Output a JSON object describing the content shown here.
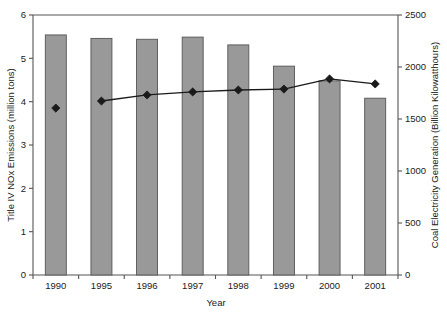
{
  "chart_data": {
    "type": "bar",
    "title": "",
    "subtitle": "",
    "xlabel": "Year",
    "categories": [
      "1990",
      "1995",
      "1996",
      "1997",
      "1998",
      "1999",
      "2000",
      "2001"
    ],
    "grid": false,
    "legend": "none",
    "axes": {
      "left": {
        "label": "Title IV NOx Emissions (million tons)",
        "ticks": [
          "0",
          "1",
          "2",
          "3",
          "4",
          "5",
          "6"
        ],
        "tick_values": [
          0,
          1,
          2,
          3,
          4,
          5,
          6
        ],
        "min": 0,
        "max": 6
      },
      "right": {
        "label": "Coal Electricity Generation (Billion Kilowatthours)",
        "ticks": [
          "0",
          "500",
          "1000",
          "1500",
          "2000",
          "2500"
        ],
        "tick_values": [
          0,
          500,
          1000,
          1500,
          2000,
          2500
        ],
        "min": 0,
        "max": 2500
      },
      "x": {
        "label": "Year"
      }
    },
    "series": [
      {
        "name": "Title IV NOx Emissions (million tons)",
        "type": "bar",
        "axis": "left",
        "color": "#999999",
        "edge_color": "#555555",
        "values": [
          5.54,
          5.46,
          5.44,
          5.49,
          5.31,
          4.82,
          4.48,
          4.08
        ]
      },
      {
        "name": "Coal Electricity Generation (Billion Kilowatthours)",
        "type": "line",
        "axis": "right",
        "color": "#1a1a1a",
        "marker": "diamond",
        "values": [
          1605,
          1673,
          1731,
          1760,
          1779,
          1788,
          1885,
          1837
        ],
        "line_breaks": [
          0
        ]
      }
    ]
  },
  "colors": {
    "bar_fill": "#999999",
    "bar_edge": "#555555",
    "line": "#1a1a1a",
    "axis": "#555555",
    "background": "#ffffff"
  }
}
